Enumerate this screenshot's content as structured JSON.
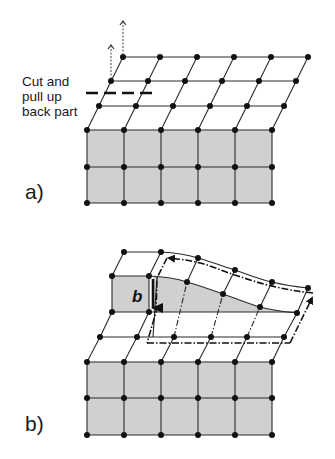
{
  "diagram": {
    "colors": {
      "line": "#2a2a2a",
      "node": "#111111",
      "shaded_face": "#d0d0d0",
      "background": "#ffffff"
    },
    "labels": {
      "cut_instruction_line1": "Cut and",
      "cut_instruction_line2": "pull up",
      "cut_instruction_line3": "back part",
      "panel_a": "a)",
      "panel_b": "b)",
      "burgers_vector": "b"
    },
    "panel_a": {
      "front_face": {
        "columns": 6,
        "rows": 3,
        "x": [
          87,
          124,
          161,
          198,
          235,
          272
        ],
        "y": [
          130,
          167,
          203
        ]
      },
      "top_face_rows": 4,
      "cut_line": {
        "style": "dashed",
        "y": 92,
        "x_start": 86,
        "x_end": 157
      },
      "pull_arrows": 2
    },
    "panel_b": {
      "front_face": {
        "columns": 6,
        "rows": 3,
        "x": [
          87,
          124,
          161,
          198,
          235,
          272
        ],
        "y": [
          362,
          398,
          435
        ]
      },
      "burgers_circuit": {
        "style": "dash-dot",
        "closed_with_gap": true
      },
      "burgers_arrow": "b"
    }
  }
}
